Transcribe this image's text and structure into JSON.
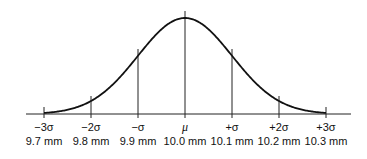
{
  "chart_data": {
    "type": "line",
    "title": "",
    "x": [
      "-3σ",
      "-2σ",
      "-σ",
      "μ",
      "+σ",
      "+2σ",
      "+3σ"
    ],
    "x_values_mm": [
      9.7,
      9.8,
      9.9,
      10.0,
      10.1,
      10.2,
      10.3
    ],
    "mean_mm": 10.0,
    "std_dev_mm": 0.1,
    "xlabel": "",
    "ylabel": ""
  },
  "axis": {
    "ticks": [
      {
        "sym": "−3σ",
        "val": "9.7 mm"
      },
      {
        "sym": "−2σ",
        "val": "9.8 mm"
      },
      {
        "sym": "−σ",
        "val": "9.9 mm"
      },
      {
        "sym": "μ",
        "val": "10.0 mm"
      },
      {
        "sym": "+σ",
        "val": "10.1 mm"
      },
      {
        "sym": "+2σ",
        "val": "10.2 mm"
      },
      {
        "sym": "+3σ",
        "val": "10.3 mm"
      }
    ]
  },
  "colors": {
    "line": "#111111"
  }
}
